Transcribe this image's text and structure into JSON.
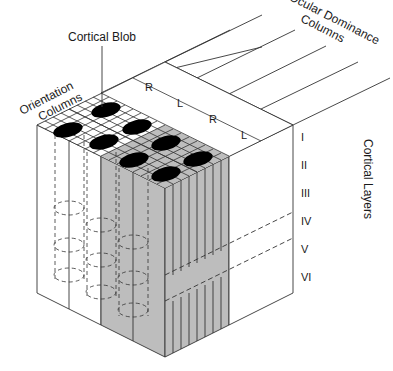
{
  "labels": {
    "cortical_blob": "Cortical Blob",
    "orientation_line1": "Orientation",
    "orientation_line2": "Columns",
    "ocular_line1": "Ocular Dominance",
    "ocular_line2": "Columns",
    "cortical_layers": "Cortical Layers"
  },
  "ocular_columns": [
    "R",
    "L",
    "R",
    "L"
  ],
  "layers": [
    "I",
    "II",
    "III",
    "IV",
    "V",
    "VI"
  ],
  "colors": {
    "line": "#333333",
    "gray_fill": "#bdbdbd",
    "blob": "#000000",
    "background": "#ffffff"
  }
}
